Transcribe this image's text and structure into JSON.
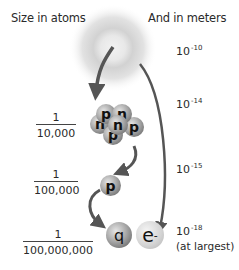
{
  "headers": {
    "left": "Size in atoms",
    "right": "And in meters"
  },
  "levels": [
    {
      "name": "atom",
      "fraction": null,
      "meters_base": "10",
      "meters_exp": "-10",
      "note": ""
    },
    {
      "name": "nucleus",
      "fraction": {
        "numerator": "1",
        "denominator": "10,000"
      },
      "meters_base": "10",
      "meters_exp": "-14",
      "note": ""
    },
    {
      "name": "proton",
      "fraction": {
        "numerator": "1",
        "denominator": "100,000"
      },
      "meters_base": "10",
      "meters_exp": "-15",
      "note": ""
    },
    {
      "name": "quark-electron",
      "fraction": {
        "numerator": "1",
        "denominator": "100,000,000"
      },
      "meters_base": "10",
      "meters_exp": "-18",
      "note": "(at largest)"
    }
  ],
  "particles": {
    "nucleus": [
      "p",
      "n",
      "n",
      "n",
      "p",
      "p"
    ],
    "proton": "p",
    "quark": "q",
    "electron": "e",
    "electron_sup": "-"
  },
  "colors": {
    "text": "#2a2a2a",
    "arrow": "#555555",
    "glow": "#bdbdbd"
  }
}
